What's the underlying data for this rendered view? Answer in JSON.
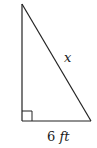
{
  "diagram": {
    "type": "right-triangle",
    "vertices": {
      "top": [
        22,
        4
      ],
      "right_angle": [
        22,
        121
      ],
      "bottom_right": [
        91,
        121
      ]
    },
    "right_angle_marker_size": 10,
    "stroke_color": "#222222",
    "labels": {
      "left_side_visible_fragment": "t",
      "left_side_number": "",
      "left_side_unit": "ft",
      "hypotenuse": "x",
      "base_number": "6",
      "base_unit": "ft"
    }
  }
}
